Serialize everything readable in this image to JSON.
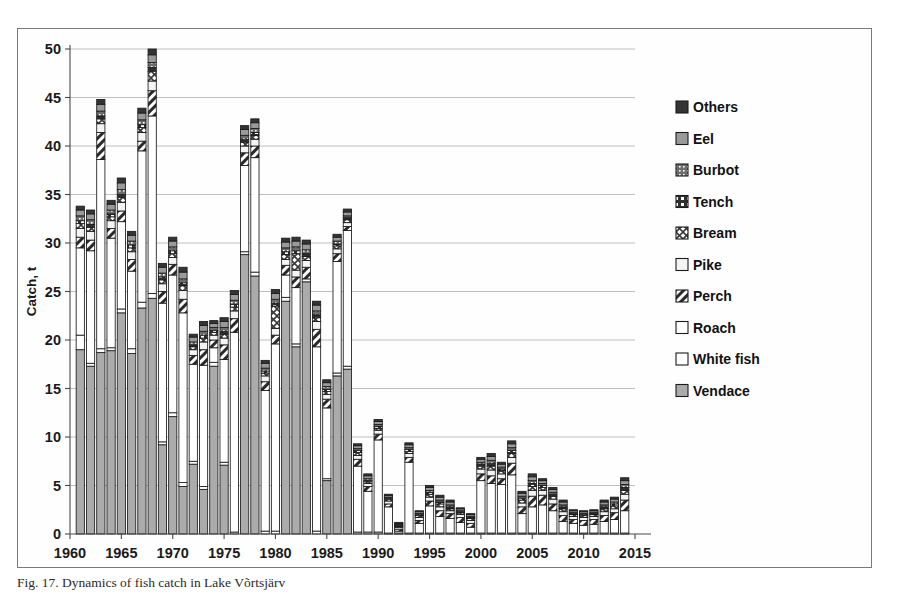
{
  "caption": "Fig. 17. Dynamics of fish catch in Lake Võrtsjärv",
  "chart_data": {
    "type": "bar",
    "stacked": true,
    "title": "",
    "xlabel": "",
    "ylabel": "Catch, t",
    "ylim": [
      0,
      50
    ],
    "yticks": [
      0,
      5,
      10,
      15,
      20,
      25,
      30,
      35,
      40,
      45,
      50
    ],
    "xlim": [
      1960,
      2015
    ],
    "xticks": [
      1960,
      1965,
      1970,
      1975,
      1980,
      1985,
      1990,
      1995,
      2000,
      2005,
      2010,
      2015
    ],
    "grid": true,
    "legend_position": "right",
    "legend_order_top_down": [
      "Others",
      "Eel",
      "Burbot",
      "Tench",
      "Bream",
      "Pike",
      "Perch",
      "Roach",
      "White fish",
      "Vendace"
    ],
    "stack_order_bottom_up": [
      "Vendace",
      "White fish",
      "Roach",
      "Perch",
      "Pike",
      "Bream",
      "Tench",
      "Burbot",
      "Eel",
      "Others"
    ],
    "series_styles": {
      "Vendace": {
        "fill": "#a8a8a8",
        "pattern": "solid-gray"
      },
      "White fish": {
        "fill": "#ffffff",
        "pattern": "solid-white"
      },
      "Roach": {
        "fill": "#ffffff",
        "pattern": "solid-white"
      },
      "Perch": {
        "fill": "#d8d8d8",
        "pattern": "diagonal-hatch"
      },
      "Pike": {
        "fill": "#f2f2f2",
        "pattern": "thin-frame"
      },
      "Bream": {
        "fill": "#e0e0e0",
        "pattern": "cross-hatch"
      },
      "Tench": {
        "fill": "#2b2b2b",
        "pattern": "half-dark"
      },
      "Burbot": {
        "fill": "#5a5a5a",
        "pattern": "dark-dot"
      },
      "Eel": {
        "fill": "#8f8f8f",
        "pattern": "mid-gray"
      },
      "Others": {
        "fill": "#3a3a3a",
        "pattern": "dark-solid"
      }
    },
    "x": [
      1961,
      1962,
      1963,
      1964,
      1965,
      1966,
      1967,
      1968,
      1969,
      1970,
      1971,
      1972,
      1973,
      1974,
      1975,
      1976,
      1977,
      1978,
      1979,
      1980,
      1981,
      1982,
      1983,
      1984,
      1985,
      1986,
      1987,
      1988,
      1989,
      1990,
      1991,
      1992,
      1993,
      1994,
      1995,
      1996,
      1997,
      1998,
      1999,
      2000,
      2001,
      2002,
      2003,
      2004,
      2005,
      2006,
      2007,
      2008,
      2009,
      2010,
      2011,
      2012,
      2013,
      2014
    ],
    "series": [
      {
        "name": "Vendace",
        "values": [
          19.0,
          17.3,
          18.7,
          18.9,
          22.8,
          18.6,
          23.3,
          24.3,
          9.2,
          12.1,
          4.9,
          7.2,
          4.6,
          17.3,
          7.1,
          0.0,
          28.8,
          26.6,
          0.0,
          0.0,
          24.0,
          19.3,
          26.0,
          0.0,
          5.5,
          16.3,
          17.0,
          0.0,
          0.0,
          0.0,
          0.0,
          0.0,
          0.0,
          0.0,
          0.0,
          0.0,
          0.0,
          0.0,
          0.0,
          0.0,
          0.0,
          0.0,
          0.0,
          0.0,
          0.0,
          0.0,
          0.0,
          0.0,
          0.0,
          0.0,
          0.0,
          0.0,
          0.0,
          0.0
        ]
      },
      {
        "name": "White fish",
        "values": [
          1.5,
          0.3,
          0.4,
          0.3,
          0.4,
          0.5,
          0.6,
          0.5,
          0.3,
          0.4,
          0.4,
          0.3,
          0.3,
          0.4,
          0.3,
          0.2,
          0.3,
          0.4,
          0.3,
          0.3,
          0.4,
          0.3,
          0.3,
          0.3,
          0.2,
          0.3,
          0.3,
          0.2,
          0.2,
          0.2,
          0.1,
          0.1,
          0.1,
          0.1,
          0.1,
          0.1,
          0.1,
          0.1,
          0.1,
          0.1,
          0.1,
          0.1,
          0.1,
          0.1,
          0.1,
          0.1,
          0.1,
          0.1,
          0.1,
          0.1,
          0.1,
          0.1,
          0.1,
          0.1
        ]
      },
      {
        "name": "Roach",
        "values": [
          9.0,
          11.6,
          19.5,
          11.3,
          9.0,
          8.0,
          15.6,
          18.3,
          14.3,
          14.2,
          17.5,
          10.0,
          12.5,
          1.5,
          10.6,
          20.6,
          8.9,
          11.8,
          14.5,
          19.3,
          2.3,
          5.8,
          0.0,
          19.0,
          7.3,
          11.5,
          14.0,
          6.8,
          4.2,
          9.5,
          2.7,
          0.2,
          7.3,
          1.0,
          2.8,
          1.7,
          1.5,
          1.1,
          0.6,
          5.4,
          5.1,
          5.0,
          6.0,
          2.0,
          2.7,
          2.9,
          2.3,
          1.2,
          1.0,
          0.8,
          0.9,
          1.2,
          1.4,
          2.3
        ]
      },
      {
        "name": "Perch",
        "values": [
          1.1,
          1.1,
          2.8,
          1.0,
          1.1,
          1.2,
          1.0,
          2.6,
          1.2,
          1.1,
          1.4,
          0.9,
          1.6,
          0.8,
          1.5,
          1.4,
          1.3,
          1.2,
          0.9,
          0.9,
          1.0,
          1.1,
          1.2,
          1.8,
          0.9,
          0.8,
          0.4,
          0.7,
          0.5,
          0.6,
          0.3,
          0.2,
          0.5,
          0.3,
          0.5,
          0.6,
          0.5,
          0.5,
          0.4,
          0.7,
          0.8,
          0.6,
          1.2,
          0.7,
          1.1,
          1.0,
          0.7,
          0.6,
          0.4,
          0.5,
          0.5,
          0.6,
          0.7,
          1.1
        ]
      },
      {
        "name": "Pike",
        "values": [
          0.9,
          0.9,
          0.9,
          0.8,
          0.9,
          0.8,
          0.9,
          1.0,
          0.8,
          0.7,
          0.9,
          0.6,
          0.8,
          0.5,
          0.7,
          0.8,
          0.7,
          0.7,
          0.6,
          0.7,
          0.6,
          0.7,
          0.7,
          0.8,
          0.5,
          0.5,
          0.4,
          0.4,
          0.3,
          0.4,
          0.3,
          0.2,
          0.4,
          0.3,
          0.4,
          0.4,
          0.3,
          0.3,
          0.3,
          0.5,
          0.6,
          0.5,
          0.6,
          0.4,
          0.6,
          0.5,
          0.5,
          0.4,
          0.3,
          0.3,
          0.3,
          0.4,
          0.4,
          0.6
        ]
      },
      {
        "name": "Bream",
        "values": [
          0.5,
          0.4,
          0.5,
          0.4,
          0.5,
          0.4,
          0.5,
          1.0,
          0.4,
          0.4,
          0.5,
          0.3,
          0.4,
          0.3,
          0.4,
          0.4,
          0.4,
          0.4,
          0.3,
          2.3,
          0.5,
          1.7,
          0.4,
          0.4,
          0.3,
          0.3,
          0.3,
          0.3,
          0.2,
          0.2,
          0.2,
          0.1,
          0.2,
          0.2,
          0.3,
          0.3,
          0.2,
          0.2,
          0.2,
          0.3,
          0.4,
          0.3,
          0.4,
          0.3,
          0.4,
          0.3,
          0.3,
          0.3,
          0.2,
          0.2,
          0.2,
          0.3,
          0.3,
          0.4
        ]
      },
      {
        "name": "Tench",
        "values": [
          0.3,
          0.3,
          0.3,
          0.3,
          0.3,
          0.3,
          0.3,
          0.4,
          0.3,
          0.3,
          0.3,
          0.2,
          0.3,
          0.2,
          0.3,
          0.3,
          0.3,
          0.3,
          0.2,
          0.3,
          0.3,
          0.3,
          0.3,
          0.3,
          0.2,
          0.2,
          0.2,
          0.2,
          0.1,
          0.2,
          0.1,
          0.1,
          0.2,
          0.1,
          0.2,
          0.2,
          0.2,
          0.1,
          0.1,
          0.2,
          0.3,
          0.2,
          0.3,
          0.2,
          0.3,
          0.2,
          0.2,
          0.2,
          0.1,
          0.1,
          0.1,
          0.2,
          0.2,
          0.3
        ]
      },
      {
        "name": "Burbot",
        "values": [
          0.5,
          0.5,
          0.5,
          0.4,
          0.5,
          0.4,
          0.5,
          0.5,
          0.4,
          0.4,
          0.4,
          0.3,
          0.4,
          0.3,
          0.4,
          0.4,
          0.4,
          0.4,
          0.3,
          0.4,
          0.4,
          0.4,
          0.4,
          0.4,
          0.3,
          0.3,
          0.2,
          0.2,
          0.2,
          0.2,
          0.1,
          0.1,
          0.2,
          0.1,
          0.2,
          0.2,
          0.2,
          0.1,
          0.1,
          0.2,
          0.3,
          0.2,
          0.3,
          0.2,
          0.3,
          0.2,
          0.2,
          0.2,
          0.1,
          0.1,
          0.1,
          0.2,
          0.2,
          0.3
        ]
      },
      {
        "name": "Eel",
        "values": [
          0.6,
          0.6,
          0.7,
          0.6,
          0.7,
          0.6,
          0.7,
          0.8,
          0.6,
          0.6,
          0.7,
          0.5,
          0.6,
          0.4,
          0.6,
          0.6,
          0.6,
          0.6,
          0.5,
          0.6,
          0.6,
          0.6,
          0.6,
          0.6,
          0.4,
          0.4,
          0.4,
          0.3,
          0.3,
          0.3,
          0.2,
          0.1,
          0.3,
          0.2,
          0.3,
          0.3,
          0.3,
          0.2,
          0.2,
          0.3,
          0.4,
          0.3,
          0.4,
          0.3,
          0.4,
          0.3,
          0.3,
          0.3,
          0.2,
          0.2,
          0.2,
          0.3,
          0.3,
          0.4
        ]
      },
      {
        "name": "Others",
        "values": [
          0.4,
          0.4,
          0.5,
          0.4,
          0.5,
          0.4,
          0.5,
          0.6,
          0.4,
          0.4,
          0.5,
          0.3,
          0.4,
          0.3,
          0.4,
          0.4,
          0.4,
          0.4,
          0.3,
          0.4,
          0.4,
          0.4,
          0.4,
          0.4,
          0.3,
          0.3,
          0.3,
          0.2,
          0.2,
          0.2,
          0.1,
          0.1,
          0.2,
          0.1,
          0.2,
          0.2,
          0.2,
          0.1,
          0.1,
          0.2,
          0.3,
          0.2,
          0.3,
          0.2,
          0.3,
          0.2,
          0.2,
          0.2,
          0.1,
          0.1,
          0.1,
          0.2,
          0.2,
          0.3
        ]
      }
    ],
    "totals": [
      33.8,
      33.4,
      44.4,
      34.4,
      36.7,
      31.2,
      43.9,
      50.0,
      27.9,
      30.6,
      27.5,
      20.6,
      21.9,
      22.0,
      22.3,
      25.5,
      42.1,
      42.8,
      17.9,
      25.4,
      30.5,
      30.8,
      30.3,
      23.9,
      15.9,
      30.9,
      33.4,
      9.4,
      6.2,
      11.8,
      4.1,
      1.2,
      9.4,
      2.4,
      5.0,
      4.0,
      3.5,
      2.9,
      2.1,
      7.9,
      8.3,
      7.4,
      9.6,
      4.4,
      6.2,
      5.7,
      4.8,
      3.5,
      2.5,
      2.4,
      2.5,
      3.4,
      3.8,
      5.7
    ]
  }
}
